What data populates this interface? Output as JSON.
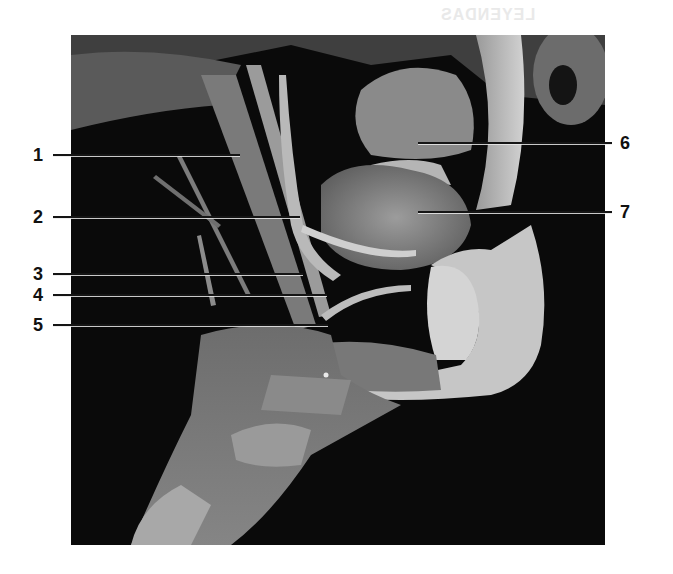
{
  "figure": {
    "bleed_through_text": "LEYENDAS",
    "labels": [
      {
        "id": "1",
        "text": "1",
        "side": "left",
        "label_x": 33,
        "label_y": 146,
        "line_from": 53,
        "line_to": 240,
        "line_y": 155
      },
      {
        "id": "2",
        "text": "2",
        "side": "left",
        "label_x": 33,
        "label_y": 208,
        "line_from": 53,
        "line_to": 300,
        "line_y": 217
      },
      {
        "id": "3",
        "text": "3",
        "side": "left",
        "label_x": 33,
        "label_y": 265,
        "line_from": 53,
        "line_to": 303,
        "line_y": 274
      },
      {
        "id": "4",
        "text": "4",
        "side": "left",
        "label_x": 33,
        "label_y": 286,
        "line_from": 53,
        "line_to": 327,
        "line_y": 295
      },
      {
        "id": "5",
        "text": "5",
        "side": "left",
        "label_x": 33,
        "label_y": 316,
        "line_from": 53,
        "line_to": 328,
        "line_y": 325
      },
      {
        "id": "6",
        "text": "6",
        "side": "right",
        "label_x": 620,
        "label_y": 134,
        "line_from": 418,
        "line_to": 612,
        "line_y": 143
      },
      {
        "id": "7",
        "text": "7",
        "side": "right",
        "label_x": 620,
        "label_y": 203,
        "line_from": 418,
        "line_to": 612,
        "line_y": 212
      }
    ]
  }
}
